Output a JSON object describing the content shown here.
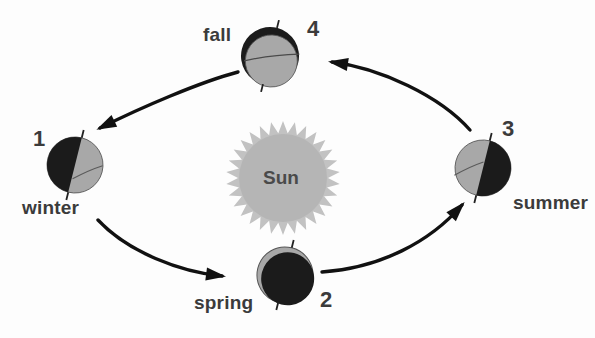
{
  "diagram": {
    "background_color": "#fdfdfd",
    "center": {
      "label": "Sun",
      "body_color": "#b5b5b5",
      "ray_color": "#c2c2c2",
      "text_color": "#4a4a4a",
      "cx": 283,
      "cy": 178,
      "radius": 44,
      "ray_count": 30,
      "ray_length": 13
    },
    "colors": {
      "dark_side": "#1b1b1b",
      "lit_side": "#a8a8a8",
      "outline": "#555555",
      "arrow": "#111111",
      "label_text": "#3b3b3b"
    },
    "positions": [
      {
        "id": "winter",
        "season_label": "winter",
        "number_label": "1",
        "cx": 75,
        "cy": 165,
        "radius": 28,
        "dark_side": "left",
        "tilt_deg": 14,
        "season_label_x": 22,
        "season_label_y": 197,
        "number_label_x": 33,
        "number_label_y": 126
      },
      {
        "id": "spring",
        "season_label": "spring",
        "number_label": "2",
        "cx": 285,
        "cy": 275,
        "radius": 28,
        "dark_side": "full",
        "tilt_deg": 14,
        "season_label_x": 194,
        "season_label_y": 292,
        "number_label_x": 320,
        "number_label_y": 287
      },
      {
        "id": "summer",
        "season_label": "summer",
        "number_label": "3",
        "cx": 483,
        "cy": 168,
        "radius": 28,
        "dark_side": "right",
        "tilt_deg": 14,
        "season_label_x": 513,
        "season_label_y": 192,
        "number_label_x": 502,
        "number_label_y": 116
      },
      {
        "id": "fall",
        "season_label": "fall",
        "number_label": "4",
        "cx": 270,
        "cy": 56,
        "radius": 29,
        "dark_side": "none",
        "tilt_deg": 14,
        "season_label_x": 203,
        "season_label_y": 24,
        "number_label_x": 307,
        "number_label_y": 16
      }
    ],
    "arrows": [
      {
        "id": "fall-to-winter",
        "from": "fall",
        "to": "winter",
        "path": "M 238 72 C 200 82 140 108 100 128",
        "head_angle_deg": 152
      },
      {
        "id": "winter-to-spring",
        "from": "winter",
        "to": "spring",
        "path": "M 98 220 C 128 252 180 272 222 276",
        "head_angle_deg": 10
      },
      {
        "id": "spring-to-summer",
        "from": "spring",
        "to": "summer",
        "path": "M 322 272 C 380 268 430 242 462 205",
        "head_angle_deg": -45
      },
      {
        "id": "summer-to-fall",
        "from": "summer",
        "to": "fall",
        "path": "M 470 130 C 440 96 380 68 332 62",
        "head_angle_deg": 190
      }
    ]
  }
}
